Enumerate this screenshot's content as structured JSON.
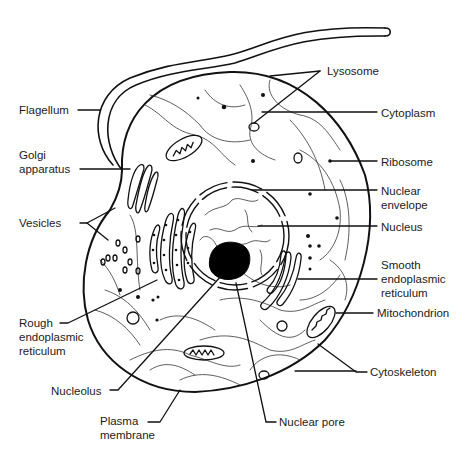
{
  "diagram": {
    "type": "labeled-illustration",
    "labels": {
      "flagellum": "Flagellum",
      "golgi": [
        "Golgi",
        "apparatus"
      ],
      "vesicles": "Vesicles",
      "rough_er": [
        "Rough",
        "endoplasmic",
        "reticulum"
      ],
      "nucleolus": "Nucleolus",
      "plasma_membrane": [
        "Plasma",
        "membrane"
      ],
      "lysosome": "Lysosome",
      "cytoplasm": "Cytoplasm",
      "ribosome": "Ribosome",
      "nuclear_envelope": [
        "Nuclear",
        "envelope"
      ],
      "nucleus": "Nucleus",
      "smooth_er": [
        "Smooth",
        "endoplasmic",
        "reticulum"
      ],
      "mitochondrion": "Mitochondrion",
      "cytoskeleton": "Cytoskeleton",
      "nuclear_pore": "Nuclear pore"
    },
    "colors": {
      "stroke": "#111111",
      "background": "#ffffff"
    }
  }
}
